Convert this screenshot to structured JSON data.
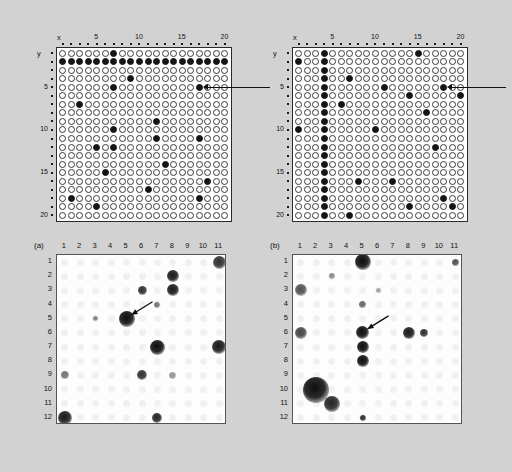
{
  "figure": {
    "background_color": "#d2d2d2",
    "grid_axis": {
      "x_name": "x",
      "y_name": "y",
      "x_ticks": [
        "5",
        "10",
        "15",
        "20"
      ],
      "x_tick_values": [
        5,
        10,
        15,
        20
      ],
      "y_ticks": [
        "5",
        "10",
        "15",
        "20"
      ],
      "y_tick_values": [
        5,
        10,
        15,
        20
      ],
      "columns": 20,
      "rows": 20,
      "open_symbol": "open-circle",
      "filled_symbol": "filled-circle"
    },
    "blot_axis": {
      "columns": [
        "1",
        "2",
        "3",
        "4",
        "5",
        "6",
        "7",
        "8",
        "9",
        "10",
        "11"
      ],
      "rows": [
        "1",
        "2",
        "3",
        "4",
        "5",
        "6",
        "7",
        "8",
        "9",
        "10",
        "11",
        "12"
      ]
    },
    "panels": [
      {
        "id": "grid-left",
        "label": ""
      },
      {
        "id": "grid-right",
        "label": ""
      },
      {
        "id": "blot-a",
        "label": "(a)"
      },
      {
        "id": "blot-b",
        "label": "(b)"
      }
    ]
  },
  "chart_data": [
    {
      "type": "scatter",
      "name": "grid-left",
      "title": "",
      "xlabel": "x",
      "ylabel": "y",
      "xlim": [
        1,
        20
      ],
      "ylim": [
        1,
        20
      ],
      "grid": false,
      "legend": "none",
      "marker_open": "open-circle",
      "marker_filled": "filled-circle",
      "filled_points": [
        [
          7,
          1
        ],
        [
          1,
          2
        ],
        [
          2,
          2
        ],
        [
          3,
          2
        ],
        [
          4,
          2
        ],
        [
          5,
          2
        ],
        [
          6,
          2
        ],
        [
          7,
          2
        ],
        [
          8,
          2
        ],
        [
          9,
          2
        ],
        [
          10,
          2
        ],
        [
          11,
          2
        ],
        [
          12,
          2
        ],
        [
          13,
          2
        ],
        [
          14,
          2
        ],
        [
          15,
          2
        ],
        [
          16,
          2
        ],
        [
          17,
          2
        ],
        [
          18,
          2
        ],
        [
          19,
          2
        ],
        [
          20,
          2
        ],
        [
          9,
          4
        ],
        [
          7,
          5
        ],
        [
          17,
          5
        ],
        [
          3,
          7
        ],
        [
          12,
          9
        ],
        [
          7,
          10
        ],
        [
          12,
          11
        ],
        [
          17,
          11
        ],
        [
          5,
          12
        ],
        [
          7,
          12
        ],
        [
          13,
          14
        ],
        [
          6,
          15
        ],
        [
          18,
          16
        ],
        [
          11,
          17
        ],
        [
          2,
          18
        ],
        [
          17,
          18
        ],
        [
          5,
          19
        ]
      ],
      "annotation": {
        "type": "pointer-arrow",
        "points_to": [
          17,
          5
        ],
        "direction": "from-right"
      }
    },
    {
      "type": "scatter",
      "name": "grid-right",
      "title": "",
      "xlabel": "x",
      "ylabel": "y",
      "xlim": [
        1,
        20
      ],
      "ylim": [
        1,
        20
      ],
      "grid": false,
      "legend": "none",
      "marker_open": "open-circle",
      "marker_filled": "filled-circle",
      "filled_points": [
        [
          4,
          1
        ],
        [
          15,
          1
        ],
        [
          1,
          2
        ],
        [
          4,
          2
        ],
        [
          4,
          3
        ],
        [
          4,
          4
        ],
        [
          7,
          4
        ],
        [
          4,
          5
        ],
        [
          11,
          5
        ],
        [
          18,
          5
        ],
        [
          4,
          6
        ],
        [
          14,
          6
        ],
        [
          20,
          6
        ],
        [
          4,
          7
        ],
        [
          6,
          7
        ],
        [
          4,
          8
        ],
        [
          16,
          8
        ],
        [
          4,
          9
        ],
        [
          1,
          10
        ],
        [
          4,
          10
        ],
        [
          10,
          10
        ],
        [
          4,
          11
        ],
        [
          4,
          12
        ],
        [
          17,
          12
        ],
        [
          4,
          13
        ],
        [
          4,
          14
        ],
        [
          4,
          15
        ],
        [
          4,
          16
        ],
        [
          8,
          16
        ],
        [
          12,
          16
        ],
        [
          4,
          17
        ],
        [
          4,
          18
        ],
        [
          18,
          18
        ],
        [
          4,
          19
        ],
        [
          14,
          19
        ],
        [
          19,
          19
        ],
        [
          4,
          20
        ],
        [
          7,
          20
        ]
      ],
      "annotation": {
        "type": "pointer-arrow",
        "points_to": [
          18,
          5
        ],
        "direction": "from-right"
      }
    },
    {
      "type": "heatmap",
      "name": "blot-a",
      "title": "(a)",
      "xlabel": "",
      "ylabel": "",
      "categories": [
        "1",
        "2",
        "3",
        "4",
        "5",
        "6",
        "7",
        "8",
        "9",
        "10",
        "11"
      ],
      "row_labels": [
        "1",
        "2",
        "3",
        "4",
        "5",
        "6",
        "7",
        "8",
        "9",
        "10",
        "11",
        "12"
      ],
      "description": "autoradiograph of colony hybridization filter, dark spots = positive signals",
      "spots": [
        {
          "col": 11,
          "row": 1,
          "intensity": 0.85,
          "size": 13
        },
        {
          "col": 8,
          "row": 2,
          "intensity": 0.95,
          "size": 12
        },
        {
          "col": 6,
          "row": 3,
          "intensity": 0.85,
          "size": 9
        },
        {
          "col": 8,
          "row": 3,
          "intensity": 0.95,
          "size": 12
        },
        {
          "col": 7,
          "row": 4,
          "intensity": 0.55,
          "size": 6
        },
        {
          "col": 3,
          "row": 5,
          "intensity": 0.5,
          "size": 5
        },
        {
          "col": 5,
          "row": 5,
          "intensity": 1.0,
          "size": 16
        },
        {
          "col": 7,
          "row": 7,
          "intensity": 1.0,
          "size": 15
        },
        {
          "col": 11,
          "row": 7,
          "intensity": 0.95,
          "size": 14
        },
        {
          "col": 1,
          "row": 9,
          "intensity": 0.55,
          "size": 8
        },
        {
          "col": 6,
          "row": 9,
          "intensity": 0.85,
          "size": 10
        },
        {
          "col": 8,
          "row": 9,
          "intensity": 0.4,
          "size": 7
        },
        {
          "col": 1,
          "row": 12,
          "intensity": 0.95,
          "size": 14
        },
        {
          "col": 7,
          "row": 12,
          "intensity": 0.9,
          "size": 10
        }
      ],
      "annotation": {
        "type": "arrow",
        "points_to": {
          "col": 5,
          "row": 5
        },
        "direction": "from-upper-right"
      }
    },
    {
      "type": "heatmap",
      "name": "blot-b",
      "title": "(b)",
      "xlabel": "",
      "ylabel": "",
      "categories": [
        "1",
        "2",
        "3",
        "4",
        "5",
        "6",
        "7",
        "8",
        "9",
        "10",
        "11"
      ],
      "row_labels": [
        "1",
        "2",
        "3",
        "4",
        "5",
        "6",
        "7",
        "8",
        "9",
        "10",
        "11",
        "12"
      ],
      "description": "autoradiograph of colony hybridization filter, dark spots = positive signals",
      "spots": [
        {
          "col": 11,
          "row": 1,
          "intensity": 0.7,
          "size": 7
        },
        {
          "col": 5,
          "row": 1,
          "intensity": 1.0,
          "size": 16
        },
        {
          "col": 1,
          "row": 3,
          "intensity": 0.7,
          "size": 12
        },
        {
          "col": 3,
          "row": 2,
          "intensity": 0.45,
          "size": 6
        },
        {
          "col": 6,
          "row": 3,
          "intensity": 0.35,
          "size": 5
        },
        {
          "col": 5,
          "row": 4,
          "intensity": 0.6,
          "size": 7
        },
        {
          "col": 5,
          "row": 6,
          "intensity": 1.0,
          "size": 13
        },
        {
          "col": 8,
          "row": 6,
          "intensity": 0.95,
          "size": 12
        },
        {
          "col": 9,
          "row": 6,
          "intensity": 0.85,
          "size": 8
        },
        {
          "col": 1,
          "row": 6,
          "intensity": 0.75,
          "size": 12
        },
        {
          "col": 5,
          "row": 7,
          "intensity": 1.0,
          "size": 12
        },
        {
          "col": 5,
          "row": 8,
          "intensity": 1.0,
          "size": 12
        },
        {
          "col": 2,
          "row": 10,
          "intensity": 1.0,
          "size": 26
        },
        {
          "col": 3,
          "row": 11,
          "intensity": 0.9,
          "size": 16
        },
        {
          "col": 5,
          "row": 12,
          "intensity": 0.85,
          "size": 6
        }
      ],
      "annotation": {
        "type": "arrow",
        "points_to": {
          "col": 5,
          "row": 6
        },
        "direction": "from-upper-right"
      }
    }
  ]
}
